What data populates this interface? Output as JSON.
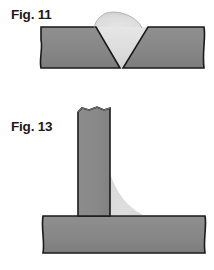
{
  "page": {
    "kind": "technical-illustration",
    "background_color": "#ffffff",
    "width": 214,
    "height": 270
  },
  "palette": {
    "base_metal": "#8a8a8a",
    "base_metal_shade": "#7e7e7e",
    "weld_metal": "#dcdcdc",
    "weld_metal_shade": "#cfcfcf",
    "outline": "#1a1a1a",
    "label_text": "#1a1a1a",
    "paper": "#ffffff"
  },
  "figures": [
    {
      "id": "fig-11",
      "label": "Fig. 11",
      "caption_position": "top-left",
      "joint_type": "single-V-groove butt weld",
      "description": "Two plates beveled to form a V groove, filled with weld metal having a convex reinforcement crown above the plate surface.",
      "parts": [
        {
          "name": "left-plate",
          "material": "base metal",
          "fill": "#8a8a8a"
        },
        {
          "name": "right-plate",
          "material": "base metal",
          "fill": "#8a8a8a"
        },
        {
          "name": "weld-bead",
          "material": "weld metal",
          "fill": "#dcdcdc"
        },
        {
          "name": "reinforcement-crown",
          "material": "weld metal",
          "fill": "#dcdcdc"
        }
      ],
      "geometry": {
        "plate_top_y": 27,
        "plate_bottom_y": 68,
        "plate_left_x": 41,
        "plate_right_x": 204,
        "groove_top_left_x": 96,
        "groove_top_right_x": 148,
        "groove_root_x": 121,
        "groove_root_y": 68,
        "crown_peak_y": 13,
        "crown_half_width": 28
      }
    },
    {
      "id": "fig-13",
      "label": "Fig. 13",
      "caption_position": "left",
      "joint_type": "T-joint fillet weld",
      "description": "A vertical web plate standing on a horizontal base plate, joined on the right side by a fillet weld with a concave face.",
      "parts": [
        {
          "name": "vertical-web-plate",
          "material": "base metal",
          "fill": "#8a8a8a"
        },
        {
          "name": "horizontal-base-plate",
          "material": "base metal",
          "fill": "#8a8a8a"
        },
        {
          "name": "fillet-weld",
          "material": "weld metal",
          "fill": "#dcdcdc"
        }
      ],
      "geometry": {
        "web_left_x": 78,
        "web_right_x": 110,
        "web_top_y": 108,
        "web_bottom_y": 216,
        "base_top_y": 216,
        "base_bottom_y": 253,
        "base_left_x": 43,
        "base_right_x": 205,
        "fillet_vertical_leg_top_y": 173,
        "fillet_horizontal_toe_x": 143,
        "fillet_face": "concave"
      }
    }
  ],
  "annotations": {
    "break_edges": "ragged torn edges indicate plates continue beyond the view",
    "hatching": "none - solid tone shading"
  }
}
